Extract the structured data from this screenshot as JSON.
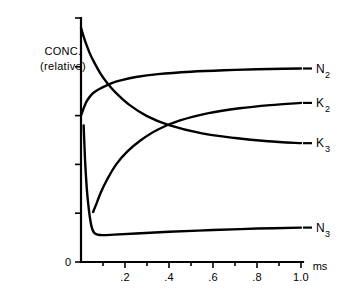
{
  "chart_data": {
    "type": "line",
    "title": "",
    "xlabel": "",
    "ylabel": "CONC. (relative)",
    "ylabel_line1": "CONC.",
    "ylabel_line2": "(relative)",
    "x_unit": "ms",
    "origin_label": "0",
    "xlim": [
      0,
      1.05
    ],
    "ylim": [
      0,
      1.0
    ],
    "grid": false,
    "legend_position": "right-inline-labels",
    "x_tick_labels": [
      ".2",
      ".4",
      ".6",
      ".8",
      "1.0"
    ],
    "x_tick_values": [
      0.2,
      0.4,
      0.6,
      0.8,
      1.0
    ],
    "x_minor_tick_values": [
      0.1,
      0.3,
      0.5,
      0.7,
      0.9
    ],
    "y_tick_count": 6,
    "y_tick_labels": [],
    "series": [
      {
        "name": "N2",
        "label_base": "N",
        "label_sub": "2",
        "description": "rises quickly from intermediate level then plateaus near top",
        "x": [
          0.0,
          0.01,
          0.02,
          0.03,
          0.05,
          0.07,
          0.1,
          0.14,
          0.18,
          0.25,
          0.35,
          0.5,
          0.65,
          0.8,
          0.92,
          1.0
        ],
        "values": [
          0.6,
          0.625,
          0.648,
          0.665,
          0.688,
          0.702,
          0.717,
          0.733,
          0.744,
          0.758,
          0.77,
          0.78,
          0.786,
          0.79,
          0.792,
          0.793
        ]
      },
      {
        "name": "K3",
        "label_base": "K",
        "label_sub": "3",
        "description": "starts at maximum and decays exponentially toward a low plateau",
        "x": [
          0.0,
          0.01,
          0.02,
          0.04,
          0.06,
          0.09,
          0.12,
          0.16,
          0.22,
          0.3,
          0.4,
          0.55,
          0.7,
          0.85,
          1.0
        ],
        "values": [
          0.96,
          0.93,
          0.902,
          0.855,
          0.818,
          0.77,
          0.733,
          0.692,
          0.644,
          0.598,
          0.561,
          0.527,
          0.508,
          0.495,
          0.487
        ]
      },
      {
        "name": "K2",
        "label_base": "K",
        "label_sub": "2",
        "description": "rises from near the transient minimum in a saturating exponential",
        "x": [
          0.055,
          0.07,
          0.09,
          0.12,
          0.16,
          0.21,
          0.27,
          0.35,
          0.45,
          0.58,
          0.72,
          0.86,
          1.0
        ],
        "values": [
          0.205,
          0.238,
          0.285,
          0.34,
          0.4,
          0.452,
          0.498,
          0.543,
          0.58,
          0.61,
          0.63,
          0.643,
          0.652
        ]
      },
      {
        "name": "N3",
        "label_base": "N",
        "label_sub": "3",
        "description": "sharp near-vertical transient drop then flat low baseline with slight rise",
        "x": [
          0.012,
          0.016,
          0.02,
          0.026,
          0.032,
          0.04,
          0.048,
          0.058,
          0.075,
          0.1,
          0.15,
          0.25,
          0.4,
          0.6,
          0.8,
          1.0
        ],
        "values": [
          0.56,
          0.47,
          0.39,
          0.305,
          0.245,
          0.185,
          0.145,
          0.122,
          0.112,
          0.11,
          0.112,
          0.117,
          0.124,
          0.131,
          0.137,
          0.141
        ]
      }
    ]
  },
  "colors": {
    "ink": "#000000",
    "background": "#ffffff"
  }
}
